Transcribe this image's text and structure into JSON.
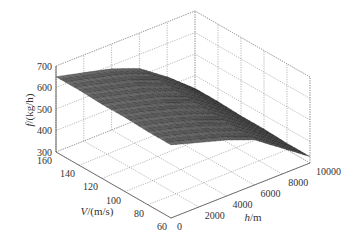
{
  "chart_data": {
    "type": "surface3d",
    "title": "",
    "xlabel": "h/m",
    "ylabel": "V/(m/s)",
    "zlabel": "f/(kg/h)",
    "x_axis": {
      "name": "h",
      "unit": "m",
      "range": [
        0,
        10000
      ],
      "ticks": [
        0,
        2000,
        4000,
        6000,
        8000,
        10000
      ]
    },
    "y_axis": {
      "name": "V",
      "unit": "m/s",
      "range": [
        60,
        160
      ],
      "ticks": [
        60,
        80,
        100,
        120,
        140,
        160
      ]
    },
    "z_axis": {
      "name": "f",
      "unit": "kg/h",
      "range": [
        300,
        700
      ],
      "ticks": [
        300,
        400,
        500,
        600,
        700
      ]
    },
    "grid": true,
    "colormap": "gray",
    "surface": {
      "h": [
        0,
        2000,
        4000,
        6000,
        8000,
        10000
      ],
      "V": [
        60,
        80,
        100,
        120,
        140,
        160
      ],
      "f": [
        [
          640,
          600,
          560,
          510,
          420,
          330
        ],
        [
          640,
          605,
          565,
          515,
          425,
          330
        ],
        [
          645,
          610,
          570,
          520,
          430,
          335
        ],
        [
          645,
          612,
          575,
          525,
          435,
          335
        ],
        [
          650,
          615,
          580,
          530,
          440,
          340
        ],
        [
          650,
          618,
          585,
          535,
          445,
          340
        ]
      ]
    }
  },
  "labels": {
    "x_ticks": [
      "0",
      "2000",
      "4000",
      "6000",
      "8000",
      "10000"
    ],
    "y_ticks": [
      "60",
      "80",
      "100",
      "120",
      "140",
      "160"
    ],
    "z_ticks": [
      "300",
      "400",
      "500",
      "600",
      "700"
    ],
    "xlabel_var": "h",
    "xlabel_unit": "/m",
    "ylabel_var": "V",
    "ylabel_unit": "/(m/s)",
    "zlabel_var": "f",
    "zlabel_unit": "/(kg/h)"
  }
}
